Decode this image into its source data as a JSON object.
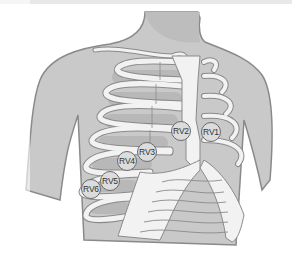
{
  "figure": {
    "colors": {
      "skin": "#c9c9c9",
      "outline": "#8a8a8a",
      "bone": "#f2f2f2",
      "intercostal": "#b8b8b8",
      "electrode_fill": "#dcdcdc",
      "electrode_border": "#6a6a6a"
    }
  },
  "electrodes": [
    {
      "label": "RV1",
      "x": 211,
      "y": 132
    },
    {
      "label": "RV2",
      "x": 181,
      "y": 131
    },
    {
      "label": "RV3",
      "x": 147,
      "y": 152
    },
    {
      "label": "RV4",
      "x": 127,
      "y": 161
    },
    {
      "label": "RV5",
      "x": 110,
      "y": 181
    },
    {
      "label": "RV6",
      "x": 91,
      "y": 189
    }
  ]
}
